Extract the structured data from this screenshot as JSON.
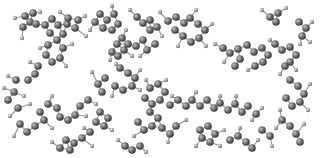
{
  "scene": {
    "description": "Ball-and-stick molecular structure render",
    "background": "#ffffff",
    "colors": {
      "carbon": "#5a5a5a",
      "carbon_highlight": "#bdbdbd",
      "hydrogen": "#8c8c8c",
      "hydrogen_highlight": "#dcdcdc",
      "bond": "#9a9a9a"
    },
    "carbons": [
      [
        25,
        16
      ],
      [
        33,
        13
      ],
      [
        30,
        22
      ],
      [
        23,
        27
      ],
      [
        36,
        24
      ],
      [
        45,
        25
      ],
      [
        52,
        19
      ],
      [
        58,
        25
      ],
      [
        50,
        33
      ],
      [
        57,
        40
      ],
      [
        63,
        34
      ],
      [
        67,
        24
      ],
      [
        75,
        28
      ],
      [
        78,
        20
      ],
      [
        68,
        18
      ],
      [
        48,
        45
      ],
      [
        46,
        55
      ],
      [
        52,
        62
      ],
      [
        60,
        58
      ],
      [
        63,
        48
      ],
      [
        38,
        66
      ],
      [
        35,
        74
      ],
      [
        28,
        80
      ],
      [
        16,
        80
      ],
      [
        95,
        22
      ],
      [
        100,
        14
      ],
      [
        107,
        20
      ],
      [
        103,
        28
      ],
      [
        112,
        30
      ],
      [
        118,
        24
      ],
      [
        114,
        14
      ],
      [
        117,
        44
      ],
      [
        112,
        52
      ],
      [
        118,
        56
      ],
      [
        124,
        50
      ],
      [
        128,
        44
      ],
      [
        122,
        38
      ],
      [
        137,
        17
      ],
      [
        143,
        23
      ],
      [
        150,
        20
      ],
      [
        157,
        27
      ],
      [
        150,
        30
      ],
      [
        143,
        40
      ],
      [
        136,
        46
      ],
      [
        147,
        50
      ],
      [
        155,
        44
      ],
      [
        168,
        21
      ],
      [
        176,
        17
      ],
      [
        184,
        23
      ],
      [
        190,
        18
      ],
      [
        198,
        24
      ],
      [
        205,
        30
      ],
      [
        199,
        38
      ],
      [
        191,
        42
      ],
      [
        183,
        36
      ],
      [
        175,
        30
      ],
      [
        223,
        48
      ],
      [
        230,
        53
      ],
      [
        238,
        49
      ],
      [
        240,
        59
      ],
      [
        235,
        66
      ],
      [
        247,
        45
      ],
      [
        254,
        52
      ],
      [
        262,
        48
      ],
      [
        268,
        55
      ],
      [
        263,
        62
      ],
      [
        255,
        66
      ],
      [
        275,
        44
      ],
      [
        282,
        50
      ],
      [
        290,
        47
      ],
      [
        296,
        55
      ],
      [
        290,
        62
      ],
      [
        285,
        66
      ],
      [
        270,
        17
      ],
      [
        278,
        13
      ],
      [
        276,
        22
      ],
      [
        299,
        22
      ],
      [
        306,
        28
      ],
      [
        302,
        36
      ],
      [
        120,
        68
      ],
      [
        128,
        73
      ],
      [
        135,
        78
      ],
      [
        132,
        86
      ],
      [
        123,
        90
      ],
      [
        115,
        86
      ],
      [
        105,
        78
      ],
      [
        98,
        84
      ],
      [
        102,
        92
      ],
      [
        88,
        100
      ],
      [
        80,
        106
      ],
      [
        75,
        115
      ],
      [
        68,
        120
      ],
      [
        60,
        117
      ],
      [
        57,
        108
      ],
      [
        48,
        104
      ],
      [
        40,
        112
      ],
      [
        44,
        120
      ],
      [
        35,
        126
      ],
      [
        27,
        132
      ],
      [
        20,
        124
      ],
      [
        150,
        88
      ],
      [
        158,
        84
      ],
      [
        165,
        92
      ],
      [
        160,
        100
      ],
      [
        152,
        104
      ],
      [
        145,
        98
      ],
      [
        170,
        105
      ],
      [
        178,
        100
      ],
      [
        186,
        106
      ],
      [
        192,
        100
      ],
      [
        200,
        106
      ],
      [
        207,
        100
      ],
      [
        214,
        108
      ],
      [
        220,
        103
      ],
      [
        228,
        110
      ],
      [
        235,
        104
      ],
      [
        242,
        112
      ],
      [
        248,
        106
      ],
      [
        256,
        114
      ],
      [
        150,
        112
      ],
      [
        158,
        118
      ],
      [
        152,
        126
      ],
      [
        144,
        130
      ],
      [
        138,
        122
      ],
      [
        162,
        128
      ],
      [
        170,
        134
      ],
      [
        176,
        126
      ],
      [
        100,
        112
      ],
      [
        108,
        118
      ],
      [
        104,
        126
      ],
      [
        96,
        122
      ],
      [
        90,
        132
      ],
      [
        82,
        138
      ],
      [
        74,
        143
      ],
      [
        66,
        140
      ],
      [
        60,
        148
      ],
      [
        70,
        150
      ],
      [
        200,
        130
      ],
      [
        208,
        126
      ],
      [
        215,
        134
      ],
      [
        210,
        142
      ],
      [
        202,
        138
      ],
      [
        230,
        140
      ],
      [
        238,
        136
      ],
      [
        246,
        142
      ],
      [
        252,
        148
      ],
      [
        290,
        80
      ],
      [
        298,
        86
      ],
      [
        304,
        94
      ],
      [
        300,
        102
      ],
      [
        292,
        106
      ],
      [
        286,
        98
      ],
      [
        282,
        120
      ],
      [
        290,
        126
      ],
      [
        296,
        134
      ],
      [
        300,
        142
      ],
      [
        262,
        130
      ],
      [
        270,
        136
      ],
      [
        14,
        92
      ],
      [
        8,
        100
      ],
      [
        18,
        108
      ],
      [
        125,
        146
      ],
      [
        132,
        150
      ],
      [
        140,
        146
      ]
    ],
    "hydrogens": [
      [
        15,
        18
      ],
      [
        22,
        38
      ],
      [
        40,
        12
      ],
      [
        60,
        12
      ],
      [
        85,
        16
      ],
      [
        86,
        36
      ],
      [
        72,
        44
      ],
      [
        40,
        48
      ],
      [
        66,
        66
      ],
      [
        30,
        62
      ],
      [
        8,
        76
      ],
      [
        112,
        6
      ],
      [
        90,
        30
      ],
      [
        126,
        30
      ],
      [
        110,
        60
      ],
      [
        132,
        56
      ],
      [
        130,
        10
      ],
      [
        160,
        12
      ],
      [
        162,
        36
      ],
      [
        140,
        56
      ],
      [
        196,
        10
      ],
      [
        212,
        24
      ],
      [
        206,
        46
      ],
      [
        178,
        46
      ],
      [
        215,
        44
      ],
      [
        224,
        62
      ],
      [
        248,
        70
      ],
      [
        270,
        40
      ],
      [
        300,
        44
      ],
      [
        296,
        70
      ],
      [
        262,
        10
      ],
      [
        286,
        8
      ],
      [
        312,
        22
      ],
      [
        310,
        42
      ],
      [
        116,
        64
      ],
      [
        140,
        70
      ],
      [
        140,
        90
      ],
      [
        112,
        96
      ],
      [
        92,
        72
      ],
      [
        96,
        104
      ],
      [
        86,
        116
      ],
      [
        52,
        96
      ],
      [
        30,
        104
      ],
      [
        52,
        128
      ],
      [
        14,
        136
      ],
      [
        10,
        116
      ],
      [
        166,
        80
      ],
      [
        172,
        96
      ],
      [
        146,
        80
      ],
      [
        196,
        92
      ],
      [
        220,
        96
      ],
      [
        236,
        96
      ],
      [
        262,
        108
      ],
      [
        252,
        120
      ],
      [
        134,
        136
      ],
      [
        168,
        142
      ],
      [
        186,
        120
      ],
      [
        112,
        130
      ],
      [
        84,
        128
      ],
      [
        92,
        146
      ],
      [
        52,
        142
      ],
      [
        196,
        146
      ],
      [
        220,
        146
      ],
      [
        224,
        130
      ],
      [
        240,
        128
      ],
      [
        258,
        140
      ],
      [
        280,
        74
      ],
      [
        310,
        84
      ],
      [
        308,
        110
      ],
      [
        280,
        110
      ],
      [
        276,
        128
      ],
      [
        304,
        124
      ],
      [
        272,
        146
      ],
      [
        4,
        88
      ],
      [
        24,
        96
      ],
      [
        118,
        140
      ],
      [
        146,
        152
      ]
    ],
    "bonds_max_len": 11
  }
}
